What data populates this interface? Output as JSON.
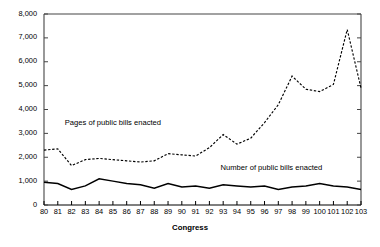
{
  "chart_data": {
    "type": "line",
    "title": "",
    "xlabel": "Congress",
    "ylabel": "",
    "grid": false,
    "legend_position": "inline-annotations",
    "x": [
      80,
      81,
      82,
      83,
      84,
      85,
      86,
      87,
      88,
      89,
      90,
      91,
      92,
      93,
      94,
      95,
      96,
      97,
      98,
      99,
      100,
      101,
      102,
      103
    ],
    "xtick_labels": [
      "80",
      "81",
      "82",
      "83",
      "84",
      "85",
      "86",
      "87",
      "88",
      "89",
      "90",
      "91",
      "92",
      "93",
      "94",
      "95",
      "96",
      "97",
      "98",
      "99",
      "100",
      "101",
      "102",
      "103"
    ],
    "xlim": [
      80,
      103
    ],
    "ylim": [
      0,
      8000
    ],
    "ytick_labels": [
      "0",
      "1,000",
      "2,000",
      "3,000",
      "4,000",
      "5,000",
      "6,000",
      "7,000",
      "8,000"
    ],
    "ytick_values": [
      0,
      1000,
      2000,
      3000,
      4000,
      5000,
      6000,
      7000,
      8000
    ],
    "series": [
      {
        "name": "Pages of public bills enacted",
        "style": "dashed",
        "color": "#000000",
        "label_x": 80,
        "label_y": 250,
        "values": [
          2300,
          2350,
          1650,
          1900,
          1950,
          1900,
          1850,
          1800,
          1850,
          2150,
          2100,
          2050,
          2400,
          2950,
          2550,
          2800,
          3450,
          4200,
          5400,
          4850,
          4750,
          5050,
          7350,
          4900
        ]
      },
      {
        "name": "Number of public bills enacted",
        "style": "solid",
        "color": "#000000",
        "values": [
          950,
          900,
          650,
          800,
          1100,
          1000,
          900,
          850,
          700,
          900,
          750,
          800,
          700,
          850,
          800,
          750,
          800,
          650,
          750,
          800,
          900,
          800,
          750,
          650
        ]
      }
    ],
    "annotations": [
      {
        "text": "Pages of public bills enacted",
        "x": 85,
        "y": 3450
      },
      {
        "text": "Number of public bills enacted",
        "x": 96.5,
        "y": 1550
      }
    ]
  },
  "axes": {
    "x_title": "Congress"
  }
}
